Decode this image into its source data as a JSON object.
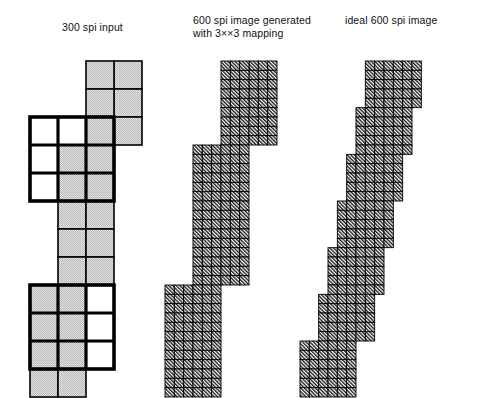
{
  "figure": {
    "type": "technical-illustration",
    "background_color": "#ffffff",
    "captions": {
      "left": "300 spi input",
      "middle": "600 spi image generated\nwith 3××3 mapping",
      "right": "ideal 600 spi image"
    },
    "colors": {
      "grid_line": "#000000",
      "gray_fill": "#cccccc",
      "white_fill": "#ffffff",
      "hatch_line": "#111111",
      "highlight_box": "#000000"
    },
    "panels": [
      {
        "name": "panel-300-spi-input",
        "caption_key": "left",
        "cell_size": 28,
        "origin": {
          "x": 30,
          "y": 61
        },
        "grid_columns": 4,
        "grid_rows": 12,
        "note": "staircase of 300 spi pixels; gray = on, white = off; two bold 3x3 windows mark the mapping neighborhoods",
        "gray_cells": [
          [
            3,
            0
          ],
          [
            2,
            0
          ],
          [
            3,
            1
          ],
          [
            2,
            1
          ],
          [
            2,
            2
          ],
          [
            3,
            2
          ],
          [
            1,
            3
          ],
          [
            2,
            3
          ],
          [
            1,
            4
          ],
          [
            2,
            4
          ],
          [
            1,
            5
          ],
          [
            2,
            5
          ],
          [
            1,
            6
          ],
          [
            2,
            6
          ],
          [
            1,
            7
          ],
          [
            2,
            7
          ],
          [
            0,
            8
          ],
          [
            1,
            8
          ],
          [
            0,
            9
          ],
          [
            1,
            9
          ],
          [
            0,
            10
          ],
          [
            1,
            10
          ],
          [
            0,
            11
          ],
          [
            1,
            11
          ]
        ],
        "white_cells": [
          [
            0,
            2
          ],
          [
            1,
            2
          ],
          [
            0,
            3
          ],
          [
            0,
            4
          ],
          [
            2,
            8
          ],
          [
            2,
            9
          ],
          [
            2,
            10
          ]
        ],
        "highlight_boxes": [
          {
            "col": 0,
            "row": 2,
            "w": 3,
            "h": 3
          },
          {
            "col": 0,
            "row": 8,
            "w": 3,
            "h": 3
          }
        ]
      },
      {
        "name": "panel-600-spi-generated",
        "caption_key": "middle",
        "cell_size": 9.3333,
        "origin": {
          "x": 165,
          "y": 61
        },
        "grid_columns": 12,
        "grid_rows": 36,
        "note": "result of 3x3 up-sampling mapping; hatched cells drawn as 600 spi dots"
      },
      {
        "name": "panel-ideal-600-spi",
        "caption_key": "right",
        "cell_size": 9.3333,
        "origin": {
          "x": 300,
          "y": 61
        },
        "grid_columns": 12,
        "grid_rows": 36,
        "note": "ideal 600 spi rendering of the same edge; smoother staircase"
      }
    ]
  }
}
